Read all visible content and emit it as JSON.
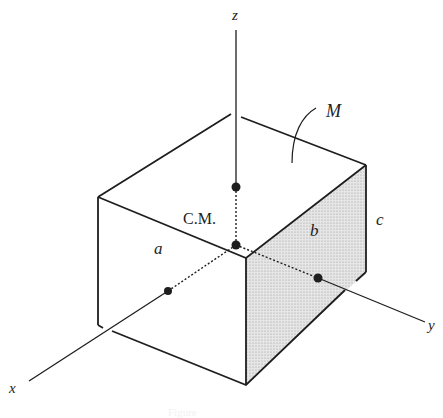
{
  "figure": {
    "labels": {
      "z_axis": "z",
      "x_axis": "x",
      "y_axis": "y",
      "mass": "M",
      "center_of_mass": "C.M.",
      "edge_a": "a",
      "edge_b": "b",
      "edge_c": "c"
    },
    "caption": "Figure",
    "colors": {
      "ink": "#1e1e1e",
      "shaded_face": "#e2e2e2",
      "background": "#ffffff"
    }
  }
}
